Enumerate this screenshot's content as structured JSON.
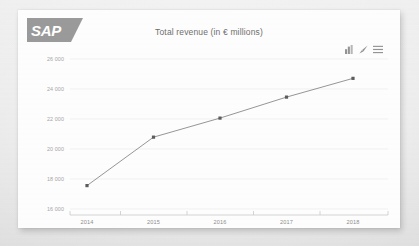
{
  "brand": {
    "logo_name": "sap-logo",
    "logo_text": "SAP",
    "logo_color": "#9a9a9a"
  },
  "toolbar": {
    "icons": [
      {
        "name": "bar-chart-icon",
        "label": "Chart type"
      },
      {
        "name": "edit-pencil-icon",
        "label": "Edit"
      },
      {
        "name": "hamburger-menu-icon",
        "label": "Menu"
      }
    ]
  },
  "chart_data": {
    "type": "line",
    "title": "Total revenue (in € millions)",
    "xlabel": "",
    "ylabel": "",
    "categories": [
      "2014",
      "2015",
      "2016",
      "2017",
      "2018"
    ],
    "values": [
      17560,
      20790,
      22060,
      23460,
      24710
    ],
    "series": [
      {
        "name": "Total revenue",
        "values": [
          17560,
          20790,
          22060,
          23460,
          24710
        ]
      }
    ],
    "ylim": [
      16000,
      26000
    ],
    "yticks": [
      16000,
      18000,
      20000,
      22000,
      24000,
      26000
    ],
    "ytick_labels": [
      "16 000",
      "18 000",
      "20 000",
      "22 000",
      "24 000",
      "26 000"
    ],
    "xticks": [
      "2014",
      "2015",
      "2016",
      "2017",
      "2018"
    ],
    "grid": true,
    "legend": false,
    "legend_position": "none",
    "line_color": "#8a8a8a",
    "marker_color": "#5c5c5c",
    "grid_color": "#ededed",
    "axis_color": "#c9c9c9"
  }
}
